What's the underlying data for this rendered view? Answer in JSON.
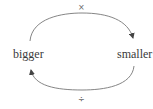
{
  "diagram": {
    "nodes": [
      {
        "id": "bigger",
        "label": "bigger"
      },
      {
        "id": "smaller",
        "label": "smaller"
      }
    ],
    "edges": [
      {
        "from": "bigger",
        "to": "smaller",
        "label": "×",
        "position": "top"
      },
      {
        "from": "smaller",
        "to": "bigger",
        "label": "÷",
        "position": "bottom"
      }
    ],
    "colors": {
      "arc": "#666666",
      "text": "#3a3a3a"
    }
  }
}
